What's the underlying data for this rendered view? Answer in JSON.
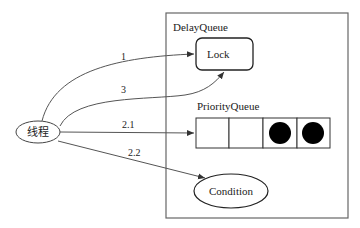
{
  "container": {
    "label": "DelayQueue"
  },
  "lock": {
    "label": "Lock"
  },
  "priority_queue": {
    "label": "PriorityQueue",
    "slots": [
      {
        "filled": false
      },
      {
        "filled": false
      },
      {
        "filled": true
      },
      {
        "filled": true
      }
    ]
  },
  "condition": {
    "label": "Condition"
  },
  "thread": {
    "label": "线程"
  },
  "edges": [
    {
      "label": "1",
      "from": "thread",
      "to": "lock"
    },
    {
      "label": "3",
      "from": "thread",
      "to": "lock"
    },
    {
      "label": "2.1",
      "from": "thread",
      "to": "priority_queue"
    },
    {
      "label": "2.2",
      "from": "thread",
      "to": "condition"
    }
  ],
  "colors": {
    "stroke": "#555555",
    "fill_token": "#000000"
  }
}
